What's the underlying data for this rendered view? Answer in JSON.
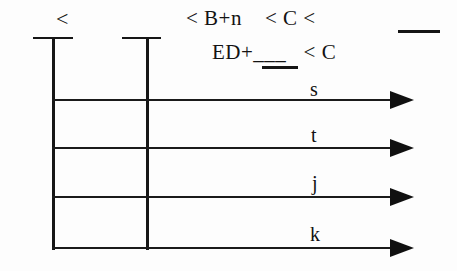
{
  "figure": {
    "type": "hand-drawn-timing-diagram",
    "background_color": "#fdfdfd",
    "ink_color": "#121212",
    "annotations": {
      "top_left_symbol": "<",
      "math_line_1": "< B+n    < C <",
      "math_line_2": "ED+___   < C"
    },
    "axes": {
      "vertical_line_1_label": "vertical-axis-left",
      "vertical_line_2_label": "vertical-axis-right"
    },
    "arrows": [
      {
        "label": "s"
      },
      {
        "label": "t"
      },
      {
        "label": "j"
      },
      {
        "label": "k"
      }
    ]
  }
}
